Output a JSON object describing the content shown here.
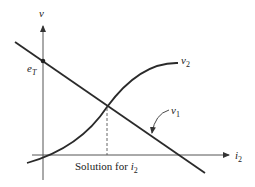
{
  "diagram": {
    "axes": {
      "y_label": "v",
      "x_label": "i",
      "x_label_sub": "2"
    },
    "points": {
      "intercept_label": "e",
      "intercept_sub": "T"
    },
    "curves": {
      "load_line_label": "v",
      "load_line_sub": "1",
      "device_curve_label": "v",
      "device_curve_sub": "2"
    },
    "annotation": {
      "solution_text": "Solution for ",
      "solution_var": "i",
      "solution_sub": "2"
    },
    "colors": {
      "ink": "#222222",
      "axis": "#555555"
    }
  }
}
